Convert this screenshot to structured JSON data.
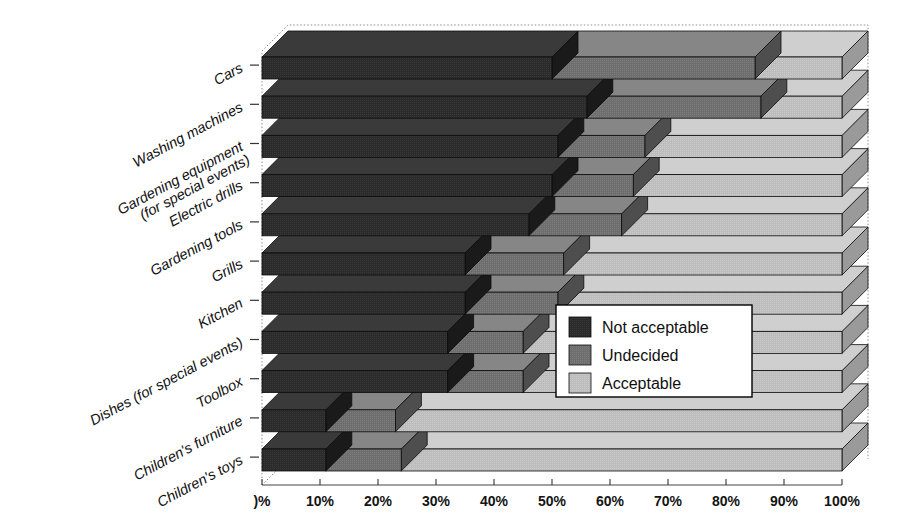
{
  "chart_data": {
    "type": "bar",
    "orientation": "horizontal",
    "stacked": true,
    "normalized_percent": true,
    "style": "3d-isometric-grayscale",
    "title": "",
    "subtitle": "",
    "xlabel": "",
    "ylabel": "",
    "xlim": [
      0,
      100
    ],
    "xticks": [
      0,
      10,
      20,
      30,
      40,
      50,
      60,
      70,
      80,
      90,
      100
    ],
    "xticklabels": [
      "0%",
      "10%",
      "20%",
      "30%",
      "40%",
      "50%",
      "60%",
      "70%",
      "80%",
      "90%",
      "100%"
    ],
    "x_first_tick_clipped": true,
    "x_first_tick_visible_text": ")%",
    "grid": false,
    "legend_position": "center-right-overlay",
    "categories": [
      "Cars",
      "Washing machines",
      "Gardening equipment\n(for special events)",
      "Electric drills",
      "Gardening tools",
      "Grills",
      "Kitchen",
      "Dishes (for special events)",
      "Toolbox",
      "Children's furniture",
      "Children's toys"
    ],
    "category_labels_flat": [
      "Cars",
      "Washing machines",
      "Gardening equipment (for special events)",
      "Electric drills",
      "Gardening tools",
      "Grills",
      "Kitchen",
      "Dishes (for special events)",
      "Toolbox",
      "Children's furniture",
      "Children's toys"
    ],
    "series": [
      {
        "name": "Not acceptable",
        "color": "#2b2b2b",
        "values": [
          50,
          56,
          51,
          50,
          46,
          35,
          35,
          32,
          32,
          11,
          11
        ]
      },
      {
        "name": "Undecided",
        "color": "#6e6e6e",
        "values": [
          35,
          30,
          15,
          14,
          16,
          17,
          16,
          13,
          13,
          12,
          13
        ]
      },
      {
        "name": "Acceptable",
        "color": "#bdbdbd",
        "values": [
          15,
          14,
          34,
          36,
          38,
          48,
          49,
          55,
          55,
          77,
          76
        ]
      }
    ],
    "legend": [
      {
        "label": "Not acceptable",
        "color": "#2b2b2b"
      },
      {
        "label": "Undecided",
        "color": "#6e6e6e"
      },
      {
        "label": "Acceptable",
        "color": "#bdbdbd"
      }
    ]
  },
  "colors": {
    "not_acceptable": "#2b2b2b",
    "undecided": "#6e6e6e",
    "acceptable": "#bdbdbd",
    "not_acceptable_top": "#3a3a3a",
    "undecided_top": "#868686",
    "acceptable_top": "#cfcfcf",
    "not_acceptable_side": "#1a1a1a",
    "undecided_side": "#4e4e4e",
    "acceptable_side": "#9a9a9a",
    "axis": "#444444",
    "background": "#ffffff",
    "legend_border": "#000000",
    "legend_background": "#ffffff"
  }
}
